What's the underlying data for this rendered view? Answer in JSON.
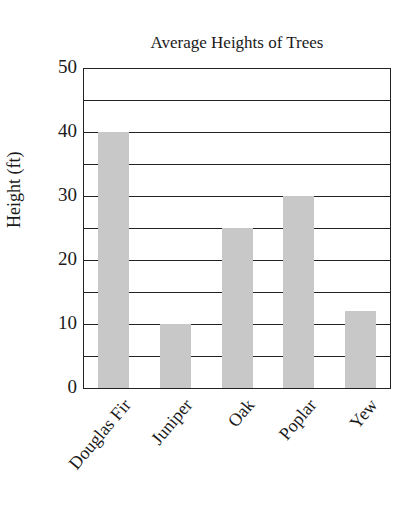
{
  "chart_data": {
    "type": "bar",
    "title": "Average Heights of Trees",
    "xlabel": "",
    "ylabel": "Height (ft)",
    "categories": [
      "Douglas Fir",
      "Juniper",
      "Oak",
      "Poplar",
      "Yew"
    ],
    "values": [
      40,
      10,
      25,
      30,
      12
    ],
    "ylim": [
      0,
      50
    ],
    "yticks": [
      0,
      10,
      20,
      30,
      40,
      50
    ],
    "gridlines": [
      5,
      10,
      15,
      20,
      25,
      30,
      35,
      40,
      45
    ],
    "grid": true,
    "legend": null,
    "bar_color": "#c8c8c8"
  }
}
